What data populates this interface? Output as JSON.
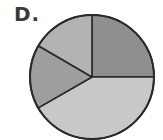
{
  "option_label": "D.",
  "chart_data": {
    "type": "pie",
    "title": "",
    "labels": [],
    "start_angle_deg": -90,
    "direction": "clockwise",
    "slices": [
      {
        "name": "slice-1",
        "value": 25.0,
        "color": "#8f8f8f"
      },
      {
        "name": "slice-2",
        "value": 41.7,
        "color": "#c8c8c8"
      },
      {
        "name": "slice-3",
        "value": 16.7,
        "color": "#9e9e9e"
      },
      {
        "name": "slice-4",
        "value": 16.6,
        "color": "#b3b3b3"
      }
    ],
    "legend": "none",
    "stroke_color": "#2a2a2a"
  },
  "geometry": {
    "cx": 92,
    "cy": 77,
    "r": 62
  }
}
